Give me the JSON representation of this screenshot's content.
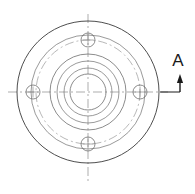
{
  "drawing": {
    "title": "Flange Top View (Plan)",
    "type": "engineering-orthographic-view",
    "canvas": {
      "width": 195,
      "height": 194,
      "background": "#ffffff"
    },
    "colors": {
      "outline": "#3a3a3a",
      "thin_line": "#6e6e6e",
      "center_line": "#8a8a8a",
      "phantom_line": "#9a9a9a",
      "annotation": "#1a1a1a"
    },
    "geometry": {
      "center": {
        "x": 88,
        "y": 92
      },
      "circles": [
        {
          "name": "flange-outer-edge",
          "radius": 71,
          "style": "solid",
          "stroke": "#3a3a3a",
          "width": 0.9
        },
        {
          "name": "flange-inner-step",
          "radius": 57,
          "style": "solid",
          "stroke": "#6e6e6e",
          "width": 0.7
        },
        {
          "name": "bolt-circle",
          "radius": 52,
          "style": "dash-dot",
          "stroke": "#9a9a9a",
          "width": 0.7
        },
        {
          "name": "hub-outer",
          "radius": 38,
          "style": "solid",
          "stroke": "#6e6e6e",
          "width": 0.8
        },
        {
          "name": "hub-step",
          "radius": 31,
          "style": "solid",
          "stroke": "#6e6e6e",
          "width": 0.7
        },
        {
          "name": "bore-counter",
          "radius": 24,
          "style": "solid",
          "stroke": "#6e6e6e",
          "width": 0.7
        },
        {
          "name": "bore-through",
          "radius": 18,
          "style": "solid",
          "stroke": "#6e6e6e",
          "width": 0.8
        }
      ],
      "bolt_holes": {
        "count": 4,
        "radius": 7,
        "bolt_circle_radius": 52,
        "angles_deg": [
          270,
          0,
          90,
          180
        ],
        "positions": [
          {
            "name": "bolt-hole-top",
            "x": 88,
            "y": 40
          },
          {
            "name": "bolt-hole-right",
            "x": 140,
            "y": 92
          },
          {
            "name": "bolt-hole-bottom",
            "x": 88,
            "y": 144
          },
          {
            "name": "bolt-hole-left",
            "x": 33,
            "y": 92
          }
        ],
        "hole_center_mark_length": 11
      },
      "center_lines": {
        "horizontal": {
          "x1": 8,
          "y1": 92,
          "x2": 168,
          "y2": 92
        },
        "vertical": {
          "x1": 88,
          "y1": 14,
          "x2": 88,
          "y2": 182
        },
        "dash_pattern": "9 3 2 3"
      }
    },
    "annotation": {
      "section_marker": {
        "label": "A",
        "label_x": 178,
        "label_y": 66,
        "arrow_direction": "up",
        "arrow_x": 180,
        "arrow_tip_y": 74,
        "arrow_tail_y": 92,
        "leader_line": {
          "x1": 160,
          "y1": 92,
          "x2": 180,
          "y2": 92
        }
      }
    }
  }
}
